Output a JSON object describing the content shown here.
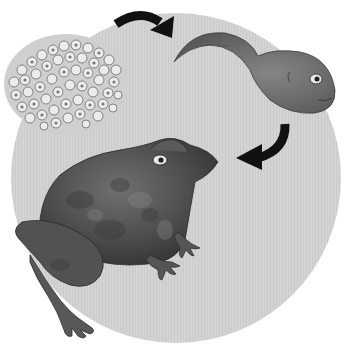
{
  "illustration": {
    "subject": "frog life cycle",
    "stages": [
      {
        "name": "frog-spawn",
        "label": "eggs"
      },
      {
        "name": "tadpole",
        "label": "tadpole"
      },
      {
        "name": "frog",
        "label": "frog"
      }
    ],
    "arrows": [
      "eggs-to-tadpole",
      "tadpole-to-frog"
    ]
  },
  "colors": {
    "background": "#ffffff",
    "circle": "#d2d2d2",
    "arrow": "#111111",
    "frog_dark": "#4a4a4a",
    "frog_mid": "#6a6a6a",
    "tadpole": "#6e6e6e",
    "egg_fill": "#e6e6e6",
    "egg_core": "#7a7a7a"
  }
}
